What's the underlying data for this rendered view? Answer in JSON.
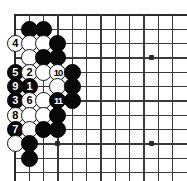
{
  "diagram": {
    "board": {
      "origin_x": 15,
      "origin_y": 15,
      "spacing": 14.33,
      "cols": 12,
      "rows": 12,
      "edge_top": true,
      "edge_left": true,
      "star_points": [
        {
          "col": 3,
          "row": 9,
          "label": "star-point-lower-left"
        },
        {
          "col": 9.55,
          "row": 3,
          "label": "star-point-upper-right"
        },
        {
          "col": 9.55,
          "row": 9,
          "label": "star-point-lower-right"
        }
      ]
    },
    "stones": [
      {
        "col": 1,
        "row": 1,
        "color": "black",
        "label": ""
      },
      {
        "col": 2,
        "row": 1,
        "color": "black",
        "label": ""
      },
      {
        "col": 0,
        "row": 2,
        "color": "white",
        "label": "4"
      },
      {
        "col": 1,
        "row": 2,
        "color": "white",
        "label": ""
      },
      {
        "col": 2,
        "row": 2,
        "color": "white",
        "label": ""
      },
      {
        "col": 3,
        "row": 2,
        "color": "black",
        "label": ""
      },
      {
        "col": 1,
        "row": 3,
        "color": "white",
        "label": ""
      },
      {
        "col": 2,
        "row": 3,
        "color": "black",
        "label": ""
      },
      {
        "col": 3,
        "row": 3,
        "color": "black",
        "label": ""
      },
      {
        "col": 0,
        "row": 4,
        "color": "black",
        "label": "5"
      },
      {
        "col": 1,
        "row": 4,
        "color": "white",
        "label": "2"
      },
      {
        "col": 2,
        "row": 4,
        "color": "white",
        "label": ""
      },
      {
        "col": 3,
        "row": 4,
        "color": "white",
        "label": "10"
      },
      {
        "col": 4,
        "row": 4,
        "color": "black",
        "label": ""
      },
      {
        "col": 0,
        "row": 5,
        "color": "black",
        "label": "9"
      },
      {
        "col": 1,
        "row": 5,
        "color": "black",
        "label": "1"
      },
      {
        "col": 3,
        "row": 5,
        "color": "white",
        "label": ""
      },
      {
        "col": 4,
        "row": 5,
        "color": "black",
        "label": ""
      },
      {
        "col": 0,
        "row": 6,
        "color": "black",
        "label": "3"
      },
      {
        "col": 1,
        "row": 6,
        "color": "white",
        "label": "6"
      },
      {
        "col": 2,
        "row": 6,
        "color": "white",
        "label": ""
      },
      {
        "col": 3,
        "row": 6,
        "color": "black",
        "label": "11"
      },
      {
        "col": 4,
        "row": 6,
        "color": "black",
        "label": ""
      },
      {
        "col": 0,
        "row": 7,
        "color": "white",
        "label": "8"
      },
      {
        "col": 1,
        "row": 7,
        "color": "white",
        "label": ""
      },
      {
        "col": 2,
        "row": 7,
        "color": "white",
        "label": ""
      },
      {
        "col": 3,
        "row": 7,
        "color": "black",
        "label": ""
      },
      {
        "col": 0,
        "row": 8,
        "color": "black",
        "label": "7"
      },
      {
        "col": 1,
        "row": 8,
        "color": "white",
        "label": ""
      },
      {
        "col": 2,
        "row": 8,
        "color": "black",
        "label": ""
      },
      {
        "col": 3,
        "row": 8,
        "color": "black",
        "label": ""
      },
      {
        "col": 0,
        "row": 9,
        "color": "white",
        "label": ""
      },
      {
        "col": 1,
        "row": 9,
        "color": "black",
        "label": ""
      },
      {
        "col": 1,
        "row": 10,
        "color": "black",
        "label": ""
      }
    ],
    "move_numbers": [
      "1",
      "2",
      "3",
      "4",
      "5",
      "6",
      "7",
      "8",
      "9",
      "10",
      "11"
    ],
    "colors": {
      "black_stone": "#080808",
      "white_stone": "#fdfdfd",
      "grid_line": "#3a3a3a",
      "board_edge": "#2b2b2b",
      "background": "#ffffff"
    }
  }
}
